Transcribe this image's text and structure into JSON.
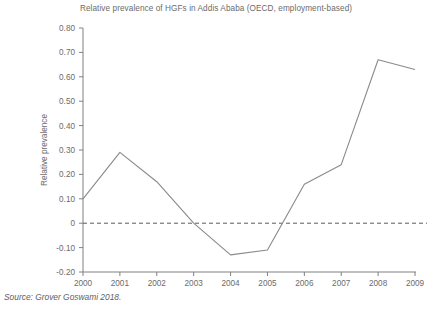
{
  "figure": {
    "title": "Relative prevalence of HGFs in Addis Ababa (OECD, employment-based)",
    "source_prefix": "Source:",
    "source_text": "Grover Goswami 2018.",
    "source_full": "Source: Grover Goswami 2018."
  },
  "colors": {
    "line": "#8a8a8a",
    "axis": "#808080",
    "zero_line": "#5a5a5a",
    "text": "#6b6b6b",
    "background": "#ffffff"
  },
  "chart_data": {
    "type": "line",
    "title": "Relative prevalence of HGFs in Addis Ababa (OECD, employment-based)",
    "xlabel": "",
    "ylabel": "Relative prevalence",
    "x": [
      2000,
      2001,
      2002,
      2003,
      2004,
      2005,
      2006,
      2007,
      2008,
      2009
    ],
    "xtick_labels": [
      "2000",
      "2001",
      "2002",
      "2003",
      "2004",
      "2005",
      "2006",
      "2007",
      "2008",
      "2009"
    ],
    "values": [
      0.1,
      0.29,
      0.17,
      0.0,
      -0.13,
      -0.11,
      0.16,
      0.24,
      0.67,
      0.63
    ],
    "ylim": [
      -0.2,
      0.8
    ],
    "ytick_values": [
      0.8,
      0.7,
      0.6,
      0.5,
      0.4,
      0.3,
      0.2,
      0.1,
      0.0,
      -0.1,
      -0.2
    ],
    "ytick_labels": [
      "0.80",
      "0.70",
      "0.60",
      "0.50",
      "0.40",
      "0.30",
      "0.20",
      "0.10",
      "0",
      "-0.10",
      "-0.20"
    ],
    "grid": false,
    "legend": null,
    "reference_lines": [
      {
        "axis": "y",
        "value": 0,
        "style": "dashed"
      }
    ],
    "series": [
      {
        "name": "Relative prevalence",
        "values": [
          0.1,
          0.29,
          0.17,
          0.0,
          -0.13,
          -0.11,
          0.16,
          0.24,
          0.67,
          0.63
        ]
      }
    ]
  }
}
